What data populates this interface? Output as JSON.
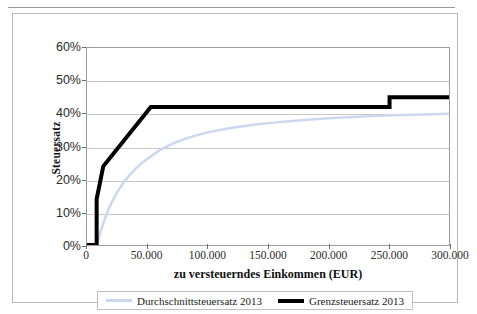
{
  "figure": {
    "frame_border_color": "#b9b9b9",
    "background": "#ffffff"
  },
  "chart_data": {
    "type": "line",
    "title": "",
    "xlabel": "zu versteuerndes Einkommen (EUR)",
    "ylabel": "Steuersatz",
    "xlim": [
      0,
      300000
    ],
    "ylim": [
      0,
      0.6
    ],
    "grid": "horizontal",
    "legend_position": "bottom",
    "x_ticks": [
      0,
      50000,
      100000,
      150000,
      200000,
      250000,
      300000
    ],
    "x_tick_labels": [
      "0",
      "50.000",
      "100.000",
      "150.000",
      "200.000",
      "250.000",
      "300.000"
    ],
    "y_ticks": [
      0,
      0.1,
      0.2,
      0.3,
      0.4,
      0.5,
      0.6
    ],
    "y_tick_labels": [
      "0%",
      "10%",
      "20%",
      "30%",
      "40%",
      "50%",
      "60%"
    ],
    "gridline_values": [
      0.1,
      0.2,
      0.3,
      0.4,
      0.5
    ],
    "series": [
      {
        "name": "Durchschnittsteuersatz 2013",
        "color": "#cbd8ee",
        "width": 2.5,
        "points": [
          [
            0,
            0.0
          ],
          [
            8004,
            0.0
          ],
          [
            9000,
            0.012
          ],
          [
            10000,
            0.025
          ],
          [
            11000,
            0.037
          ],
          [
            12000,
            0.049
          ],
          [
            13469,
            0.065
          ],
          [
            15000,
            0.082
          ],
          [
            17000,
            0.101
          ],
          [
            20000,
            0.126
          ],
          [
            25000,
            0.161
          ],
          [
            30000,
            0.189
          ],
          [
            35000,
            0.212
          ],
          [
            40000,
            0.231
          ],
          [
            45000,
            0.248
          ],
          [
            52882,
            0.27
          ],
          [
            60000,
            0.288
          ],
          [
            70000,
            0.307
          ],
          [
            80000,
            0.322
          ],
          [
            90000,
            0.333
          ],
          [
            100000,
            0.343
          ],
          [
            120000,
            0.357
          ],
          [
            140000,
            0.367
          ],
          [
            160000,
            0.375
          ],
          [
            180000,
            0.381
          ],
          [
            200000,
            0.386
          ],
          [
            220000,
            0.39
          ],
          [
            250730,
            0.395
          ],
          [
            270000,
            0.397
          ],
          [
            300000,
            0.4
          ]
        ]
      },
      {
        "name": "Grenzsteuersatz 2013",
        "color": "#000000",
        "width": 4,
        "points": [
          [
            0,
            0.0
          ],
          [
            8004,
            0.0
          ],
          [
            8004,
            0.14
          ],
          [
            13469,
            0.2397
          ],
          [
            52881,
            0.42
          ],
          [
            250730,
            0.42
          ],
          [
            250730,
            0.45
          ],
          [
            300000,
            0.45
          ]
        ]
      }
    ]
  },
  "legend": {
    "entries": [
      {
        "label": "Durchschnittsteuersatz 2013",
        "swatch": "avg"
      },
      {
        "label": "Grenzsteuersatz 2013",
        "swatch": "marg"
      }
    ]
  }
}
